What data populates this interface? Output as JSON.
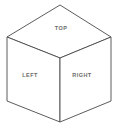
{
  "figure": {
    "name": "isometric-cube-diagram",
    "background_color": "#ffffff",
    "stroke_color": "#4a4a4a",
    "stroke_width": 0.9,
    "label_color": "#6a6a6a"
  },
  "labels": {
    "top": "TOP",
    "left": "LEFT",
    "right": "RIGHT"
  },
  "geometry": {
    "apex": "60,5",
    "upper_left": "7,37",
    "upper_right": "111,37",
    "center": "60,58",
    "lower_left": "7,101",
    "lower_right": "111,101",
    "bottom": "60,122",
    "top_face": "60,5 111,37 60,58 7,37",
    "left_face": "7,37 60,58 60,122 7,101",
    "right_face": "60,58 111,37 111,101 60,122"
  }
}
